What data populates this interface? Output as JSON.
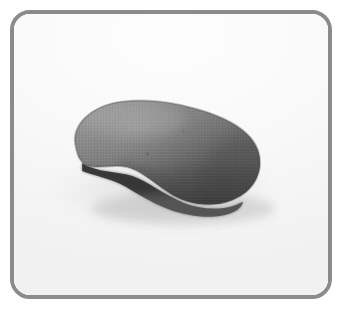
{
  "image": {
    "alt_description": "Photograph of a single gray kidney-bean shaped object resting on a plain white surface",
    "subject": "gray kidney bean shaped object",
    "background_description": "plain white / very light gray seamless surface",
    "frame": {
      "style": "rounded rectangle outline",
      "border_color": "#8b8b8b",
      "border_width_px": 4,
      "corner_radius_px": 20,
      "outer_margin_px": 10
    },
    "canvas": {
      "width_px": 342,
      "height_px": 314,
      "outer_background_color": "#ffffff"
    },
    "palette": {
      "backdrop_light": "#fdfdfd",
      "backdrop_mid": "#f4f4f4",
      "backdrop_shade": "#ececec",
      "object_highlight": "#8f8f8f",
      "object_mid": "#6e6e6e",
      "object_shade": "#585858",
      "object_dark": "#454545",
      "contact_shadow": "#1d1d1d",
      "ambient_shadow": "rgba(120,120,120,0.16)"
    },
    "object_geometry": {
      "shape": "kidney-bean / cashew silhouette, convex top, concave underside",
      "bounding_box_px": {
        "x": 67,
        "y": 96,
        "width": 188,
        "height": 108
      },
      "orientation": "horizontal, opening of the curve facing down-left",
      "light_direction": "upper-left",
      "surface_texture": "fine woven fabric-like weave"
    }
  }
}
